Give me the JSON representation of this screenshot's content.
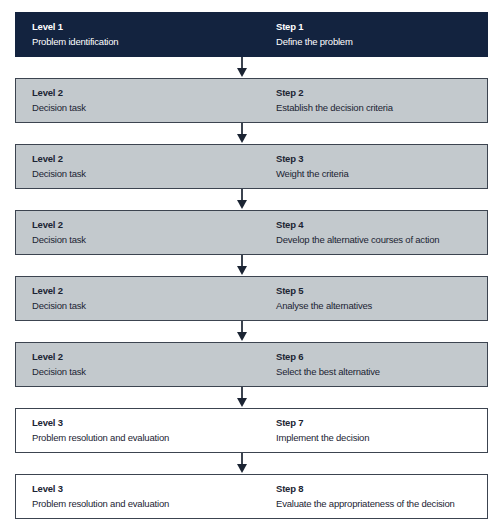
{
  "diagram": {
    "type": "flowchart",
    "colors": {
      "level1_fill": "#13233f",
      "level2_fill": "#c3c9cd",
      "level3_fill": "#ffffff",
      "border": "#3c4450",
      "arrow": "#1b2433"
    },
    "steps": [
      {
        "level": "Level 1",
        "level_desc": "Problem identification",
        "step": "Step 1",
        "step_desc": "Define the problem"
      },
      {
        "level": "Level 2",
        "level_desc": "Decision task",
        "step": "Step 2",
        "step_desc": "Establish the decision criteria"
      },
      {
        "level": "Level 2",
        "level_desc": "Decision task",
        "step": "Step 3",
        "step_desc": "Weight the criteria"
      },
      {
        "level": "Level 2",
        "level_desc": "Decision task",
        "step": "Step 4",
        "step_desc": "Develop the alternative courses of action"
      },
      {
        "level": "Level 2",
        "level_desc": "Decision task",
        "step": "Step 5",
        "step_desc": "Analyse the alternatives"
      },
      {
        "level": "Level 2",
        "level_desc": "Decision task",
        "step": "Step 6",
        "step_desc": "Select the best alternative"
      },
      {
        "level": "Level 3",
        "level_desc": "Problem resolution and evaluation",
        "step": "Step 7",
        "step_desc": "Implement the decision"
      },
      {
        "level": "Level 3",
        "level_desc": "Problem resolution and evaluation",
        "step": "Step 8",
        "step_desc": "Evaluate the appropriateness of the decision"
      }
    ]
  }
}
